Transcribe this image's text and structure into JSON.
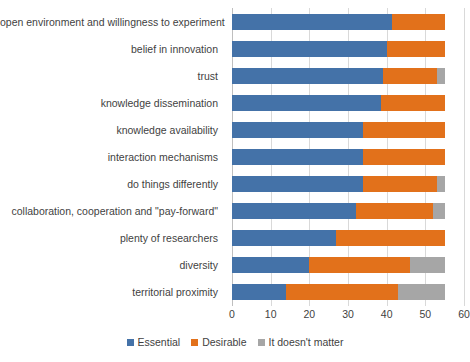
{
  "chart_data": {
    "type": "bar",
    "orientation": "horizontal",
    "stacked": true,
    "title": "",
    "xlabel": "",
    "ylabel": "",
    "xlim": [
      0,
      60
    ],
    "xticks": [
      0,
      10,
      20,
      30,
      40,
      50,
      60
    ],
    "grid": true,
    "legend_position": "bottom",
    "categories": [
      "open environment and willingness to experiment",
      "belief in innovation",
      "trust",
      "knowledge dissemination",
      "knowledge availability",
      "interaction mechanisms",
      "do things differently",
      "collaboration, cooperation and \"pay-forward\"",
      "plenty of researchers",
      "diversity",
      "territorial proximity"
    ],
    "series": [
      {
        "name": "Essential",
        "color": "#4472a8",
        "values": [
          41.5,
          40,
          39,
          38.5,
          34,
          34,
          34,
          32,
          27,
          20,
          14
        ]
      },
      {
        "name": "Desirable",
        "color": "#e2711b",
        "values": [
          13.5,
          15,
          14,
          16.5,
          21,
          21,
          19,
          20,
          28,
          26,
          29
        ]
      },
      {
        "name": "It doesn't matter",
        "color": "#a6a6a6",
        "values": [
          0,
          0,
          2,
          0,
          0,
          0,
          2,
          3,
          0,
          9,
          12
        ]
      }
    ],
    "totals": [
      55,
      55,
      55,
      55,
      55,
      55,
      55,
      55,
      55,
      55,
      55
    ]
  },
  "legend": {
    "items": [
      {
        "label": "Essential",
        "color": "#4472a8"
      },
      {
        "label": "Desirable",
        "color": "#e2711b"
      },
      {
        "label": "It doesn't matter",
        "color": "#a6a6a6"
      }
    ]
  }
}
